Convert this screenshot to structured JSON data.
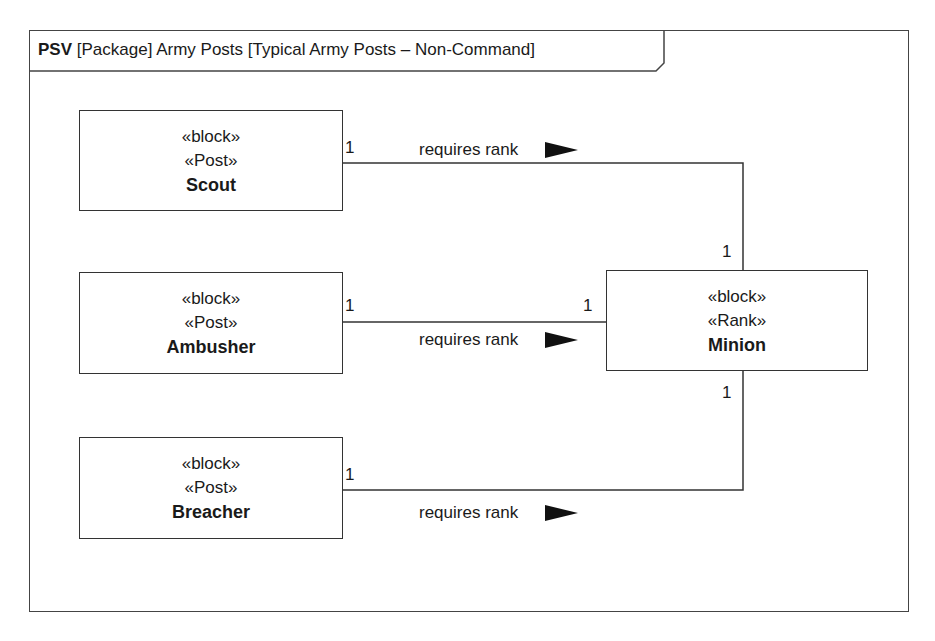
{
  "diagram": {
    "frame": {
      "kind": "PSV",
      "title": "[Package] Army Posts [Typical Army Posts – Non-Command]"
    },
    "blocks": [
      {
        "id": "scout",
        "stereotypes": [
          "«block»",
          "«Post»"
        ],
        "name": "Scout"
      },
      {
        "id": "ambusher",
        "stereotypes": [
          "«block»",
          "«Post»"
        ],
        "name": "Ambusher"
      },
      {
        "id": "breacher",
        "stereotypes": [
          "«block»",
          "«Post»"
        ],
        "name": "Breacher"
      },
      {
        "id": "minion",
        "stereotypes": [
          "«block»",
          "«Rank»"
        ],
        "name": "Minion"
      }
    ],
    "associations": [
      {
        "from": "Scout",
        "to": "Minion",
        "label": "requires rank",
        "from_mult": "1",
        "to_mult": "1"
      },
      {
        "from": "Ambusher",
        "to": "Minion",
        "label": "requires rank",
        "from_mult": "1",
        "to_mult": "1"
      },
      {
        "from": "Breacher",
        "to": "Minion",
        "label": "requires rank",
        "from_mult": "1",
        "to_mult": "1"
      }
    ]
  }
}
